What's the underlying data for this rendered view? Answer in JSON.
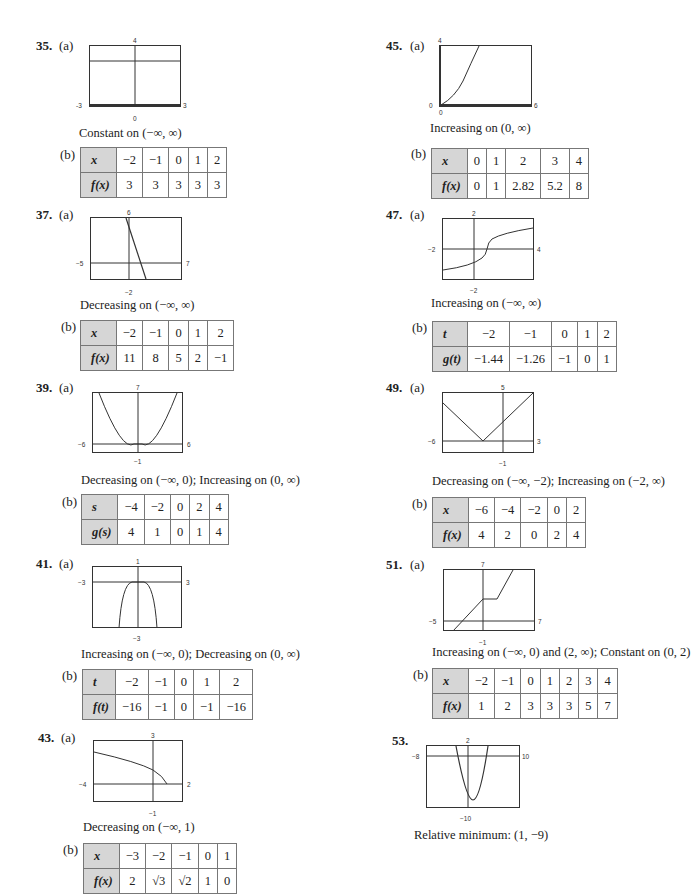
{
  "problems": {
    "p35": {
      "number": "35.",
      "part_a": "(a)",
      "part_b": "(b)",
      "graph": {
        "ymax": "4",
        "ymin": "0",
        "xmin": "-3",
        "xmax": "3"
      },
      "description": "Constant on (−∞, ∞)",
      "table": {
        "header_x": "x",
        "header_y": "f(x)",
        "x": [
          "−2",
          "−1",
          "0",
          "1",
          "2"
        ],
        "y": [
          "3",
          "3",
          "3",
          "3",
          "3"
        ]
      }
    },
    "p37": {
      "number": "37.",
      "part_a": "(a)",
      "part_b": "(b)",
      "graph": {
        "ymax": "6",
        "ymin": "−2",
        "xmin": "−5",
        "xmax": "7"
      },
      "description": "Decreasing on (−∞, ∞)",
      "table": {
        "header_x": "x",
        "header_y": "f(x)",
        "x": [
          "−2",
          "−1",
          "0",
          "1",
          "2"
        ],
        "y": [
          "11",
          "8",
          "5",
          "2",
          "−1"
        ]
      }
    },
    "p39": {
      "number": "39.",
      "part_a": "(a)",
      "part_b": "(b)",
      "graph": {
        "ymax": "7",
        "ymin": "−1",
        "xmin": "−6",
        "xmax": "6"
      },
      "description": "Decreasing on (−∞, 0); Increasing on (0, ∞)",
      "table": {
        "header_x": "s",
        "header_y": "g(s)",
        "x": [
          "−4",
          "−2",
          "0",
          "2",
          "4"
        ],
        "y": [
          "4",
          "1",
          "0",
          "1",
          "4"
        ]
      }
    },
    "p41": {
      "number": "41.",
      "part_a": "(a)",
      "part_b": "(b)",
      "graph": {
        "ymax": "1",
        "ymin": "−3",
        "xmin": "−3",
        "xmax": "3"
      },
      "description": "Increasing on (−∞, 0); Decreasing on (0, ∞)",
      "table": {
        "header_x": "t",
        "header_y": "f(t)",
        "x": [
          "−2",
          "−1",
          "0",
          "1",
          "2"
        ],
        "y": [
          "−16",
          "−1",
          "0",
          "−1",
          "−16"
        ]
      }
    },
    "p43": {
      "number": "43.",
      "part_a": "(a)",
      "part_b": "(b)",
      "graph": {
        "ymax": "3",
        "ymin": "−1",
        "xmin": "−4",
        "xmax": "2"
      },
      "description": "Decreasing on (−∞, 1)",
      "table": {
        "header_x": "x",
        "header_y": "f(x)",
        "x": [
          "−3",
          "−2",
          "−1",
          "0",
          "1"
        ],
        "y": [
          "2",
          "√3",
          "√2",
          "1",
          "0"
        ]
      }
    },
    "p45": {
      "number": "45.",
      "part_a": "(a)",
      "part_b": "(b)",
      "graph": {
        "ymax": "4",
        "ymin": "0",
        "xmin": "0",
        "xmax": "6"
      },
      "description": "Increasing on (0, ∞)",
      "table": {
        "header_x": "x",
        "header_y": "f(x)",
        "x": [
          "0",
          "1",
          "2",
          "3",
          "4"
        ],
        "y": [
          "0",
          "1",
          "2.82",
          "5.2",
          "8"
        ]
      }
    },
    "p47": {
      "number": "47.",
      "part_a": "(a)",
      "part_b": "(b)",
      "graph": {
        "ymax": "2",
        "ymin": "−2",
        "xmin": "−2",
        "xmax": "4"
      },
      "description": "Increasing on (−∞, ∞)",
      "table": {
        "header_x": "t",
        "header_y": "g(t)",
        "x": [
          "−2",
          "−1",
          "0",
          "1",
          "2"
        ],
        "y": [
          "−1.44",
          "−1.26",
          "−1",
          "0",
          "1"
        ]
      }
    },
    "p49": {
      "number": "49.",
      "part_a": "(a)",
      "part_b": "(b)",
      "graph": {
        "ymax": "5",
        "ymin": "−1",
        "xmin": "−6",
        "xmax": "3"
      },
      "description": "Decreasing on (−∞, −2); Increasing on (−2, ∞)",
      "table": {
        "header_x": "x",
        "header_y": "f(x)",
        "x": [
          "−6",
          "−4",
          "−2",
          "0",
          "2"
        ],
        "y": [
          "4",
          "2",
          "0",
          "2",
          "4"
        ]
      }
    },
    "p51": {
      "number": "51.",
      "part_a": "(a)",
      "part_b": "(b)",
      "graph": {
        "ymax": "7",
        "ymin": "−1",
        "xmin": "−5",
        "xmax": "7"
      },
      "description": "Increasing on (−∞, 0) and (2, ∞); Constant on (0, 2)",
      "table": {
        "header_x": "x",
        "header_y": "f(x)",
        "x": [
          "−2",
          "−1",
          "0",
          "1",
          "2",
          "3",
          "4"
        ],
        "y": [
          "1",
          "2",
          "3",
          "3",
          "3",
          "5",
          "7"
        ]
      }
    },
    "p53": {
      "number": "53.",
      "graph": {
        "ymax": "2",
        "ymin": "−10",
        "xmin": "−8",
        "xmax": "10"
      },
      "description": "Relative minimum: (1, −9)"
    }
  }
}
